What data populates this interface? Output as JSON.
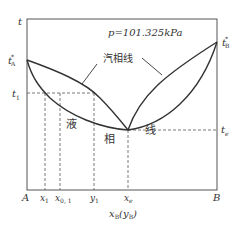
{
  "diagram": {
    "title": "p=101.325kPa",
    "y_axis_label": "t",
    "x_axis_label": "x",
    "x_axis_label_sub": "B",
    "x_axis_label_paren": "(y",
    "x_axis_label_paren_sub": "B",
    "x_axis_label_close": ")",
    "left_corner": "A",
    "right_corner": "B",
    "left_temp": {
      "main": "t",
      "sup": "*",
      "sub": "A"
    },
    "right_temp": {
      "main": "t",
      "sup": "*",
      "sub": "B"
    },
    "t1": {
      "main": "t",
      "sub": "1"
    },
    "te": {
      "main": "t",
      "sub": "e"
    },
    "x_ticks": [
      {
        "main": "x",
        "sub": "1"
      },
      {
        "main": "x",
        "sub": "0, 1"
      },
      {
        "main": "y",
        "sub": "1"
      },
      {
        "main": "x",
        "sub": "e"
      }
    ],
    "vapor_line_label": "汽相线",
    "liquid_line_label_1": "液",
    "liquid_line_label_2": "相",
    "liquid_line_label_3": "线",
    "line_color": "#333333"
  }
}
